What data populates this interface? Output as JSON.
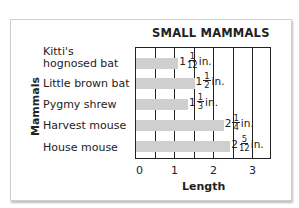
{
  "chart_data": {
    "type": "bar",
    "orientation": "horizontal",
    "title": "SMALL MAMMALS",
    "xlabel": "Length",
    "ylabel": "Mammals",
    "categories": [
      "Kitti's hognosed bat",
      "Little brown bat",
      "Pygmy shrew",
      "Harvest mouse",
      "House mouse"
    ],
    "values": [
      1.0833,
      1.5,
      1.3333,
      2.25,
      2.4167
    ],
    "value_labels": [
      {
        "whole": "1",
        "num": "1",
        "den": "12",
        "unit": "in."
      },
      {
        "whole": "1",
        "num": "1",
        "den": "2",
        "unit": "in."
      },
      {
        "whole": "1",
        "num": "1",
        "den": "3",
        "unit": "in."
      },
      {
        "whole": "2",
        "num": "1",
        "den": "4",
        "unit": "in."
      },
      {
        "whole": "2",
        "num": "5",
        "den": "12",
        "unit": "in."
      }
    ],
    "xticks": [
      "0",
      "1",
      "2",
      "3"
    ],
    "xlim": [
      0,
      3.5
    ],
    "grid": "vertical every 0.5",
    "bar_color": "#cfcfcf"
  },
  "labels": {
    "title": "SMALL MAMMALS",
    "xlabel": "Length",
    "ylabel": "Mammals",
    "cat0a": "Kitti's",
    "cat0b": "hognosed bat",
    "cat1": "Little brown bat",
    "cat2": "Pygmy shrew",
    "cat3": "Harvest mouse",
    "cat4": "House mouse"
  }
}
